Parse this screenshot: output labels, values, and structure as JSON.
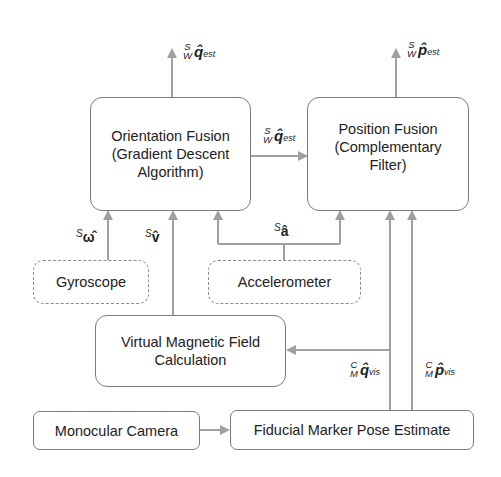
{
  "diagram": {
    "nodes": {
      "orientation_fusion": {
        "lines": [
          "Orientation Fusion",
          "(Gradient Descent",
          "Algorithm)"
        ]
      },
      "position_fusion": {
        "lines": [
          "Position Fusion",
          "(Complementary",
          "Filter)"
        ]
      },
      "gyroscope": {
        "label": "Gyroscope",
        "style": "dashed"
      },
      "accelerometer": {
        "label": "Accelerometer",
        "style": "dashed"
      },
      "virtual_magnetic": {
        "lines": [
          "Virtual Magnetic Field",
          "Calculation"
        ]
      },
      "monocular_camera": {
        "label": "Monocular Camera"
      },
      "fiducial_marker": {
        "label": "Fiducial Marker Pose Estimate"
      }
    },
    "edge_labels": {
      "q_est_out": {
        "sup_left": "S",
        "sub_left": "W",
        "symbol": "q̂",
        "subscript": "est"
      },
      "p_est_out": {
        "sup_left": "S",
        "sub_left": "W",
        "symbol": "p̂",
        "subscript": "est"
      },
      "q_est_mid": {
        "sup_left": "S",
        "sub_left": "W",
        "symbol": "q̂",
        "subscript": "est"
      },
      "omega": {
        "sup_left": "S",
        "symbol": "ω̂"
      },
      "v": {
        "sup_left": "S",
        "symbol": "v̂"
      },
      "a": {
        "sup_left": "S",
        "symbol": "â"
      },
      "q_vis": {
        "sup_left": "C",
        "sub_left": "M",
        "symbol": "q̂",
        "subscript": "vis"
      },
      "p_vis": {
        "sup_left": "C",
        "sub_left": "M",
        "symbol": "p̂",
        "subscript": "vis"
      }
    },
    "colors": {
      "line": "#9a9a9a",
      "border": "#7a7a7a",
      "text": "#222222"
    }
  }
}
